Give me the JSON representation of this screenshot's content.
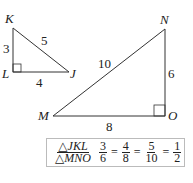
{
  "triangle_small": {
    "name": "JKL",
    "vertices": {
      "K": "K",
      "L": "L",
      "J": "J"
    },
    "sides": {
      "KL": "3",
      "KJ": "5",
      "LJ": "4"
    },
    "right_angle_at": "L"
  },
  "triangle_large": {
    "name": "MNO",
    "vertices": {
      "M": "M",
      "N": "N",
      "O": "O"
    },
    "sides": {
      "MN": "10",
      "NO": "6",
      "MO": "8"
    },
    "right_angle_at": "O"
  },
  "ratio": {
    "label_top": "△JKL",
    "label_bottom": "△MNO",
    "fractions": [
      {
        "num": "3",
        "den": "6"
      },
      {
        "num": "4",
        "den": "8"
      },
      {
        "num": "5",
        "den": "10"
      },
      {
        "num": "1",
        "den": "2"
      }
    ],
    "equals": "="
  },
  "colors": {
    "stroke": "#333333",
    "box_border": "#bbbbbb"
  }
}
